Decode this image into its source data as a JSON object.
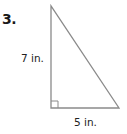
{
  "problem": {
    "number_label": "3."
  },
  "figure": {
    "shape": "right-triangle",
    "stroke_color": "#8a8a8a",
    "height_label": "7 in.",
    "base_label": "5 in.",
    "height_value": 7,
    "base_value": 5,
    "unit": "in.",
    "right_angle_marker": true
  }
}
